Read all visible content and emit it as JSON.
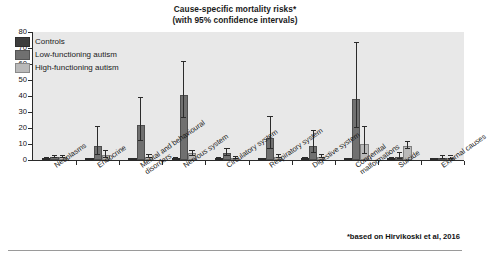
{
  "title": {
    "line1": "Cause-specific mortality risks*",
    "line2": "(with 95% confidence intervals)"
  },
  "footnote": "*based on Hirvikoski et al, 2016",
  "colors": {
    "controls": "#3d3d3d",
    "low_functioning": "#707070",
    "high_functioning": "#b9b9b9",
    "plot_background": "#e8e8e8",
    "axis": "#2a2a2a",
    "page_background": "#ffffff"
  },
  "legend": {
    "position": "top-left-inside",
    "items": [
      {
        "label": "Controls",
        "color": "#3d3d3d"
      },
      {
        "label": "Low-functioning autism",
        "color": "#707070"
      },
      {
        "label": "High-functioning autism",
        "color": "#b9b9b9"
      }
    ]
  },
  "chart_data": {
    "type": "bar",
    "title": "Cause-specific mortality risks* (with 95% confidence intervals)",
    "xlabel": "",
    "ylabel": "",
    "ylim": [
      0,
      80
    ],
    "yticks": [
      0,
      10,
      20,
      30,
      40,
      50,
      60,
      70,
      80
    ],
    "grid": false,
    "legend_position": "upper left",
    "error_bars": "95% confidence intervals",
    "categories": [
      "Neoplasms",
      "Endocrine",
      "Mental and behavioural disorders",
      "Nervous system",
      "Circulatory system",
      "Respiratory system",
      "Digestive system",
      "Congenital malformations",
      "Suicide",
      "External causes"
    ],
    "series": [
      {
        "name": "Controls",
        "color": "#3d3d3d",
        "values": [
          0.8,
          0.6,
          0.6,
          0.7,
          1.0,
          0.6,
          0.7,
          0.5,
          0.9,
          0.4
        ],
        "ci_low": [
          0.5,
          0.4,
          0.4,
          0.5,
          0.7,
          0.4,
          0.5,
          0.3,
          0.6,
          0.2
        ],
        "ci_high": [
          1.1,
          0.9,
          0.9,
          1.0,
          1.4,
          0.9,
          1.0,
          0.8,
          1.3,
          0.7
        ]
      },
      {
        "name": "Low-functioning autism",
        "color": "#707070",
        "values": [
          1.6,
          9.0,
          21.6,
          40.4,
          4.4,
          13.5,
          8.6,
          38.2,
          2.0,
          1.2
        ],
        "ci_low": [
          1.0,
          3.4,
          12.0,
          26.2,
          2.4,
          6.6,
          4.1,
          19.8,
          0.7,
          0.4
        ],
        "ci_high": [
          2.5,
          20.5,
          38.6,
          61.0,
          7.0,
          27.0,
          18.0,
          73.2,
          4.2,
          2.6
        ]
      },
      {
        "name": "High-functioning autism",
        "color": "#b9b9b9",
        "values": [
          1.7,
          3.0,
          1.8,
          4.2,
          1.1,
          2.0,
          2.1,
          9.8,
          8.7,
          1.0
        ],
        "ci_low": [
          1.1,
          1.4,
          1.0,
          2.6,
          0.6,
          1.1,
          1.2,
          4.0,
          6.7,
          0.4
        ],
        "ci_high": [
          2.4,
          5.6,
          3.0,
          5.8,
          1.8,
          3.2,
          3.4,
          20.6,
          11.0,
          2.2
        ]
      }
    ]
  }
}
